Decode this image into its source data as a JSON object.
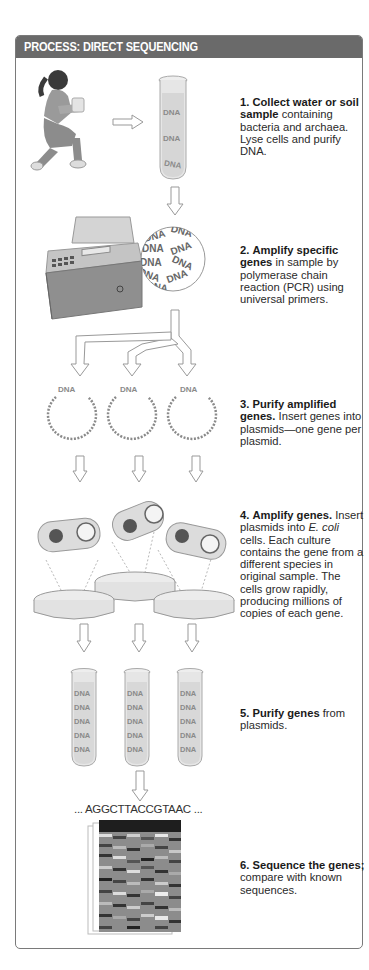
{
  "header": {
    "title": "PROCESS: DIRECT SEQUENCING"
  },
  "colors": {
    "header_bg": "#6a6a6a",
    "frame_border": "#7a7a7a",
    "text": "#2a2a2a",
    "illustration_gray": "#bdbdbd"
  },
  "labels": {
    "dna": "DNA",
    "sequence": "... AGGCTTACCGTAAC ..."
  },
  "steps": [
    {
      "number": "1.",
      "bold": "Collect water or soil sample",
      "text": " containing bacteria and archaea. Lyse cells and purify DNA."
    },
    {
      "number": "2.",
      "bold": "Amplify specific genes",
      "text": " in sample by polymerase chain reaction (PCR) using universal primers."
    },
    {
      "number": "3.",
      "bold": "Purify amplified genes.",
      "text": " Insert genes into plasmids—one gene per plasmid."
    },
    {
      "number": "4.",
      "bold": "Amplify genes.",
      "text_before_italic": " Insert plasmids into ",
      "italic": "E. coli",
      "text_after_italic": " cells. Each culture contains the gene from a different species in original sample. The cells grow rapidly, producing millions of copies of each gene."
    },
    {
      "number": "5.",
      "bold": "Purify genes",
      "text": " from plasmids."
    },
    {
      "number": "6.",
      "bold": "Sequence the genes;",
      "text": " compare with known sequences."
    }
  ],
  "illustrations": {
    "step1": [
      "kneeling-person-icon",
      "arrow-right-icon",
      "test-tube-icon"
    ],
    "step2": [
      "pcr-machine-icon",
      "dna-magnifier-icon"
    ],
    "step3": [
      "branching-arrows-icon",
      "plasmid-icon",
      "plasmid-icon",
      "plasmid-icon"
    ],
    "step4": [
      "ecoli-cell-icon",
      "petri-dish-icon"
    ],
    "step5": [
      "test-tube-icon",
      "test-tube-icon",
      "test-tube-icon"
    ],
    "step6": [
      "sequencing-gel-icon"
    ]
  }
}
